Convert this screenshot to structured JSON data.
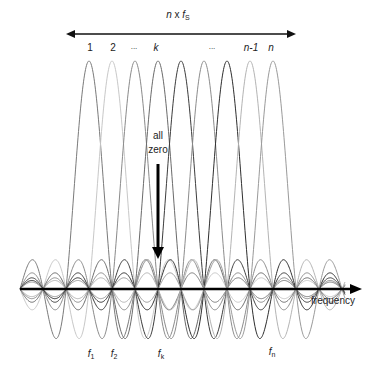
{
  "diagram": {
    "bandwidth_label": {
      "n": "n",
      "x": "x",
      "f": "f",
      "sub": "S"
    },
    "subcarrier_indices": [
      "1",
      "2",
      "...",
      "k",
      "...",
      "n-1",
      "n"
    ],
    "annotation": {
      "line1": "all",
      "line2": "zero"
    },
    "axis_label": "frequency",
    "freq_labels": [
      {
        "base": "f",
        "sub": "1"
      },
      {
        "base": "f",
        "sub": "2"
      },
      {
        "base": "f",
        "sub": "k"
      },
      {
        "base": "f",
        "sub": "n"
      }
    ],
    "geometry": {
      "axis_y": 289,
      "axis_x_start": 20,
      "axis_x_end": 362,
      "peak_y": 61,
      "first_center_x": 89,
      "spacing": 23,
      "num_subcarriers": 9,
      "curve_x_start": 20,
      "curve_x_end": 345,
      "curve_colors": [
        "#7a7a7a",
        "#c8c8c8",
        "#8a8a8a",
        "#6a6a6a",
        "#3c3c3c",
        "#8c8c8c",
        "#2e2e2e",
        "#b4b4b4",
        "#9a9a9a"
      ]
    }
  }
}
